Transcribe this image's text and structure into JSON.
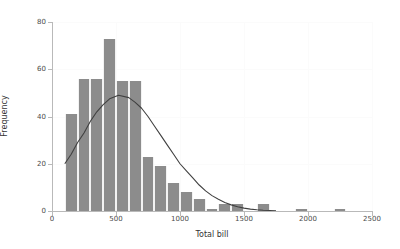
{
  "chart_data": {
    "type": "bar",
    "title": "",
    "xlabel": "Total bill",
    "ylabel": "Frequency",
    "xlim": [
      0,
      2500
    ],
    "ylim": [
      0,
      80
    ],
    "xticks": [
      0,
      500,
      1000,
      1500,
      2000,
      2500
    ],
    "yticks": [
      0,
      20,
      40,
      60,
      80
    ],
    "xtick_labels": [
      "0",
      "500",
      "1000",
      "1500",
      "2000",
      "2500"
    ],
    "ytick_labels": [
      "0",
      "20",
      "40",
      "60",
      "80"
    ],
    "grid": true,
    "legend": "none",
    "bin_width": 100,
    "bin_edges": [
      100,
      200,
      300,
      400,
      500,
      600,
      700,
      800,
      900,
      1000,
      1100,
      1200,
      1300,
      1400,
      1500,
      1600,
      1700,
      1800,
      1900,
      2000,
      2100,
      2200,
      2300
    ],
    "categories": [
      "100-200",
      "200-300",
      "300-400",
      "400-500",
      "500-600",
      "600-700",
      "700-800",
      "800-900",
      "900-1000",
      "1000-1100",
      "1100-1200",
      "1200-1300",
      "1300-1400",
      "1400-1500",
      "1500-1600",
      "1600-1700",
      "1700-1800",
      "1800-1900",
      "1900-2000",
      "2000-2100",
      "2100-2200",
      "2200-2300"
    ],
    "values": [
      41,
      56,
      56,
      73,
      55,
      55,
      23,
      19,
      12,
      8,
      5,
      1,
      3,
      3,
      0,
      3,
      0,
      0,
      1,
      0,
      0,
      1
    ],
    "bars": [
      {
        "x0": 100,
        "x1": 200,
        "height": 41
      },
      {
        "x0": 200,
        "x1": 300,
        "height": 56
      },
      {
        "x0": 300,
        "x1": 400,
        "height": 56
      },
      {
        "x0": 400,
        "x1": 500,
        "height": 73
      },
      {
        "x0": 500,
        "x1": 600,
        "height": 55
      },
      {
        "x0": 600,
        "x1": 700,
        "height": 55
      },
      {
        "x0": 700,
        "x1": 800,
        "height": 23
      },
      {
        "x0": 800,
        "x1": 900,
        "height": 19
      },
      {
        "x0": 900,
        "x1": 1000,
        "height": 12
      },
      {
        "x0": 1000,
        "x1": 1100,
        "height": 8
      },
      {
        "x0": 1100,
        "x1": 1200,
        "height": 5
      },
      {
        "x0": 1200,
        "x1": 1300,
        "height": 1
      },
      {
        "x0": 1300,
        "x1": 1400,
        "height": 3
      },
      {
        "x0": 1400,
        "x1": 1500,
        "height": 3
      },
      {
        "x0": 1600,
        "x1": 1700,
        "height": 3
      },
      {
        "x0": 1900,
        "x1": 2000,
        "height": 1
      },
      {
        "x0": 2200,
        "x1": 2300,
        "height": 1
      }
    ],
    "overlay_curve": {
      "name": "normal density fit",
      "kind": "line",
      "peak_x": 520,
      "peak_y": 49,
      "points": [
        {
          "x": 100,
          "y": 20
        },
        {
          "x": 150,
          "y": 24
        },
        {
          "x": 200,
          "y": 29
        },
        {
          "x": 250,
          "y": 33
        },
        {
          "x": 300,
          "y": 38
        },
        {
          "x": 350,
          "y": 42
        },
        {
          "x": 400,
          "y": 45
        },
        {
          "x": 450,
          "y": 47.5
        },
        {
          "x": 520,
          "y": 49
        },
        {
          "x": 600,
          "y": 48
        },
        {
          "x": 650,
          "y": 46
        },
        {
          "x": 700,
          "y": 43.5
        },
        {
          "x": 750,
          "y": 40
        },
        {
          "x": 800,
          "y": 36
        },
        {
          "x": 850,
          "y": 32
        },
        {
          "x": 900,
          "y": 28
        },
        {
          "x": 950,
          "y": 24
        },
        {
          "x": 1000,
          "y": 20
        },
        {
          "x": 1050,
          "y": 17
        },
        {
          "x": 1100,
          "y": 14
        },
        {
          "x": 1150,
          "y": 11
        },
        {
          "x": 1200,
          "y": 8.5
        },
        {
          "x": 1250,
          "y": 6.5
        },
        {
          "x": 1300,
          "y": 5
        },
        {
          "x": 1350,
          "y": 3.6
        },
        {
          "x": 1400,
          "y": 2.6
        },
        {
          "x": 1450,
          "y": 1.8
        },
        {
          "x": 1500,
          "y": 1.2
        },
        {
          "x": 1550,
          "y": 0.8
        },
        {
          "x": 1600,
          "y": 0.5
        },
        {
          "x": 1650,
          "y": 0.3
        },
        {
          "x": 1700,
          "y": 0.2
        },
        {
          "x": 1750,
          "y": 0.1
        }
      ]
    },
    "colors": {
      "bar_fill": "#8c8c8c",
      "bar_edge": "#f2f2f2",
      "curve": "#404040",
      "axis": "#b9b9b9",
      "grid": "#fbfbfb",
      "text": "#333333",
      "background": "#ffffff"
    }
  }
}
